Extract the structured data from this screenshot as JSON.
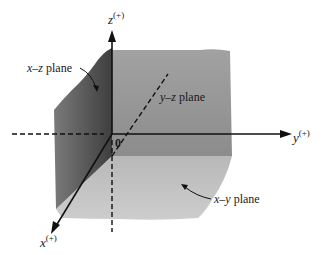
{
  "diagram": {
    "type": "3d-coordinate-planes",
    "axes": {
      "z": {
        "label": "z",
        "sign": "(+)"
      },
      "y": {
        "label": "y",
        "sign": "(+)"
      },
      "x": {
        "label": "x",
        "sign": "(+)"
      }
    },
    "origin_label": "0",
    "planes": {
      "xz": {
        "label_var": "x–z",
        "label_word": " plane",
        "color": "#5e5e5e"
      },
      "yz": {
        "label_var": "y–z",
        "label_word": " plane",
        "color": "#9c9c9c"
      },
      "xy": {
        "label_var": "x–y",
        "label_word": " plane",
        "color": "#c4c4c4"
      }
    }
  }
}
